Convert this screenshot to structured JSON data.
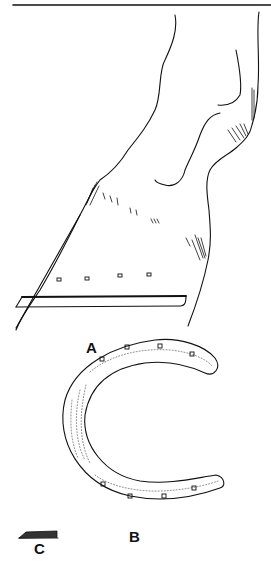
{
  "figure": {
    "panels": [
      {
        "id": "A",
        "label": "A",
        "description": "side view of horse lower leg and hoof with shoe and nail holes"
      },
      {
        "id": "B",
        "label": "B",
        "description": "ground surface view of horseshoe with nail holes"
      },
      {
        "id": "C",
        "label": "C",
        "description": "cross-section of shoe"
      }
    ],
    "colors": {
      "line": "#111111",
      "background": "#ffffff"
    }
  }
}
